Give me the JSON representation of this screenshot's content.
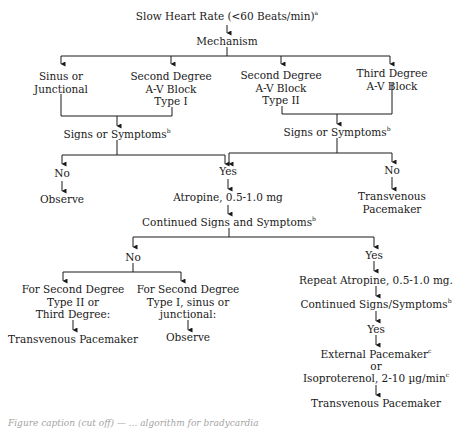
{
  "flowchart": {
    "root": {
      "label": "Slow Heart Rate (<60 Beats/min)",
      "footnote": "a"
    },
    "mechanism": {
      "label": "Mechanism"
    },
    "mechanisms": [
      {
        "label_lines": [
          "Sinus or",
          "Junctional"
        ]
      },
      {
        "label_lines": [
          "Second Degree",
          "A-V Block",
          "Type I"
        ]
      },
      {
        "label_lines": [
          "Second Degree",
          "A-V Block",
          "Type II"
        ]
      },
      {
        "label_lines": [
          "Third Degree",
          "A-V Block"
        ]
      }
    ],
    "signs_left": {
      "label": "Signs or Symptoms",
      "footnote": "b"
    },
    "signs_right": {
      "label": "Signs or Symptoms",
      "footnote": "b"
    },
    "left_no": {
      "label": "No",
      "outcome": "Observe"
    },
    "yes": {
      "label": "Yes"
    },
    "right_no": {
      "label": "No",
      "outcome_lines": [
        "Transvenous",
        "Pacemaker"
      ]
    },
    "atropine": {
      "label": "Atropine, 0.5-1.0 mg"
    },
    "continued": {
      "label": "Continued Signs and Symptoms",
      "footnote": "b"
    },
    "cont_no": {
      "label": "No",
      "branches": [
        {
          "condition_lines": [
            "For Second Degree",
            "Type II or",
            "Third Degree:"
          ],
          "outcome": "Transvenous Pacemaker"
        },
        {
          "condition_lines": [
            "For Second Degree",
            "Type I, sinus or",
            "junctional:"
          ],
          "outcome": "Observe"
        }
      ]
    },
    "cont_yes": {
      "label": "Yes",
      "steps": {
        "repeat": "Repeat Atropine, 0.5-1.0 mg.",
        "continued2": "Continued Signs/Symptoms",
        "continued2_footnote": "b",
        "yes2": "Yes",
        "external": "External Pacemaker",
        "external_footnote": "c",
        "or": "or",
        "isoproterenol": "Isoproterenol, 2-10 µg/min",
        "isoproterenol_footnote": "c",
        "final": "Transvenous Pacemaker"
      }
    }
  },
  "caption_partial": "Figure caption (cut off) — ... algorithm for bradycardia"
}
